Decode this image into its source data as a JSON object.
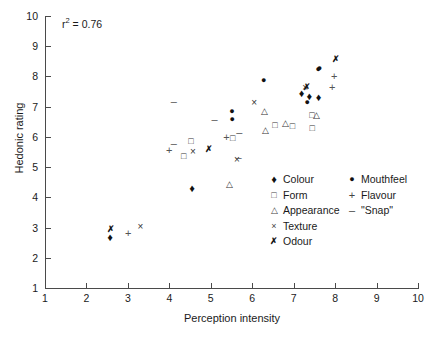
{
  "chart_data": {
    "type": "scatter",
    "title": "",
    "xlabel": "Perception intensity",
    "ylabel": "Hedonic rating",
    "xlim": [
      1,
      10
    ],
    "ylim": [
      1,
      10
    ],
    "xticks": [
      "1",
      "2",
      "3",
      "4",
      "5",
      "6",
      "7",
      "8",
      "9",
      "10"
    ],
    "yticks": [
      "1",
      "2",
      "3",
      "4",
      "5",
      "6",
      "7",
      "8",
      "9",
      "10"
    ],
    "grid": false,
    "annotation": "r² = 0.76",
    "annotation_value": 0.76,
    "legend_position": "inside-lower-right",
    "series": [
      {
        "name": "Colour",
        "marker": "filled-diamond",
        "points": [
          [
            2.57,
            2.69
          ],
          [
            4.55,
            4.31
          ],
          [
            7.19,
            7.45
          ],
          [
            7.38,
            7.34
          ],
          [
            7.6,
            7.31
          ]
        ]
      },
      {
        "name": "Form",
        "marker": "open-square",
        "points": [
          [
            4.35,
            5.36
          ],
          [
            4.52,
            5.87
          ],
          [
            5.53,
            5.96
          ],
          [
            6.55,
            6.39
          ],
          [
            6.97,
            6.37
          ],
          [
            7.44,
            6.71
          ],
          [
            7.45,
            6.31
          ]
        ]
      },
      {
        "name": "Appearance",
        "marker": "open-triangle",
        "points": [
          [
            5.44,
            4.43
          ],
          [
            6.3,
            6.85
          ],
          [
            6.8,
            6.47
          ],
          [
            6.32,
            6.22
          ],
          [
            7.56,
            6.74
          ]
        ]
      },
      {
        "name": "Texture",
        "marker": "x-cross",
        "points": [
          [
            3.3,
            3.03
          ],
          [
            4.57,
            5.5
          ],
          [
            5.63,
            5.23
          ],
          [
            6.05,
            7.13
          ],
          [
            7.28,
            7.63
          ]
        ]
      },
      {
        "name": "Odour",
        "marker": "bold-x",
        "points": [
          [
            2.59,
            2.95
          ],
          [
            4.96,
            5.6
          ],
          [
            7.31,
            7.66
          ],
          [
            8.02,
            8.57
          ]
        ]
      },
      {
        "name": "Mouthfeel",
        "marker": "filled-circle",
        "points": [
          [
            5.52,
            6.6
          ],
          [
            5.51,
            6.85
          ],
          [
            6.28,
            7.87
          ],
          [
            7.33,
            7.16
          ],
          [
            7.59,
            8.23
          ],
          [
            7.62,
            8.29
          ]
        ]
      },
      {
        "name": "Flavour",
        "marker": "plus",
        "points": [
          [
            3.01,
            2.83
          ],
          [
            4.0,
            5.56
          ],
          [
            5.38,
            5.99
          ],
          [
            7.98,
            8.03
          ],
          [
            7.93,
            7.66
          ]
        ]
      },
      {
        "name": "\"Snap\"",
        "marker": "minus",
        "points": [
          [
            4.11,
            7.19
          ],
          [
            4.11,
            5.79
          ],
          [
            5.09,
            6.6
          ],
          [
            5.69,
            6.15
          ],
          [
            5.67,
            5.32
          ]
        ]
      }
    ]
  },
  "axes": {
    "x_title": "Perception intensity",
    "y_title": "Hedonic rating",
    "x_ticks": [
      "1",
      "2",
      "3",
      "4",
      "5",
      "6",
      "7",
      "8",
      "9",
      "10"
    ],
    "y_ticks": [
      "1",
      "2",
      "3",
      "4",
      "5",
      "6",
      "7",
      "8",
      "9",
      "10"
    ]
  },
  "annotation": {
    "r_symbol": "r",
    "r_exponent": "2",
    "r_equals": " = 0.76"
  },
  "legend": {
    "column_a": [
      {
        "label": "Colour",
        "symbol": "♦"
      },
      {
        "label": "Form",
        "symbol": "□"
      },
      {
        "label": "Appearance",
        "symbol": "△"
      },
      {
        "label": "Texture",
        "symbol": "×"
      },
      {
        "label": "Odour",
        "symbol": "✗"
      }
    ],
    "column_b": [
      {
        "label": "Mouthfeel",
        "symbol": "●"
      },
      {
        "label": "Flavour",
        "symbol": "+"
      },
      {
        "label": "\"Snap\"",
        "symbol": "–"
      }
    ]
  },
  "colors": {
    "axis": "#4a4a4a",
    "marker_dark": "#111111",
    "marker_open": "#333333",
    "marker_light": "#555555"
  }
}
